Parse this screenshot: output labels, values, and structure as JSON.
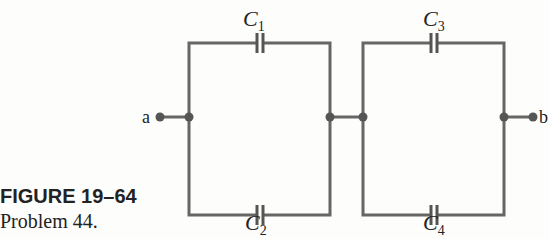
{
  "figure": {
    "title": "FIGURE 19–64",
    "caption": "Problem 44."
  },
  "circuit": {
    "wire_color": "#666666",
    "nodes": {
      "a": "a",
      "b": "b"
    },
    "capacitors": [
      {
        "id": "C1",
        "symbol": "C",
        "subscript": "1",
        "position": "left-top"
      },
      {
        "id": "C2",
        "symbol": "C",
        "subscript": "2",
        "position": "left-bottom"
      },
      {
        "id": "C3",
        "symbol": "C",
        "subscript": "3",
        "position": "right-top"
      },
      {
        "id": "C4",
        "symbol": "C",
        "subscript": "4",
        "position": "right-bottom"
      }
    ],
    "topology": "(C1 || C2) in series with (C3 || C4) between a and b"
  }
}
